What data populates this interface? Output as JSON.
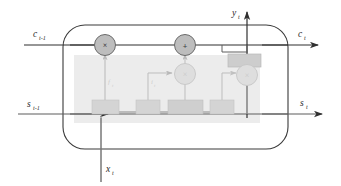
{
  "diagram": {
    "colors": {
      "line_dark": "#2f2f2f",
      "line_gray": "#8f8f8f",
      "panel_fill": "#ececec",
      "node_fill": "#c4c4c4",
      "node_fill_faint": "#dcdcdc",
      "box_fill": "#d6d6d6",
      "box_fill_faint": "#e2e2e2",
      "background": "#ffffff"
    }
  },
  "labels": {
    "cell_in": {
      "base": "c",
      "sub": "t-1"
    },
    "cell_out": {
      "base": "c",
      "sub": "t"
    },
    "state_in": {
      "base": "s",
      "sub": "t-1"
    },
    "state_out": {
      "base": "s",
      "sub": "t"
    },
    "input": {
      "base": "x",
      "sub": "t"
    },
    "output": {
      "base": "y",
      "sub": "t"
    },
    "forget_gate": {
      "base": "f",
      "sub": "t"
    },
    "input_gate": {
      "base": "i",
      "sub": "t"
    },
    "output_gate": {
      "base": "o",
      "sub": "t"
    }
  },
  "operators": {
    "forget_multiply": "×",
    "cell_add": "+",
    "input_multiply": "×",
    "output_multiply": "×"
  },
  "blocks": {
    "forget_activation": "",
    "input_activation": "",
    "candidate_activation": "",
    "output_activation": "",
    "cell_squash": "",
    "peephole": ""
  },
  "arrows": {
    "cell_in_arrow": "arrow-right",
    "cell_out_arrow": "arrow-right",
    "state_in_arrow": "arrow-right",
    "state_out_arrow": "arrow-right",
    "output_arrow": "arrow-up"
  }
}
